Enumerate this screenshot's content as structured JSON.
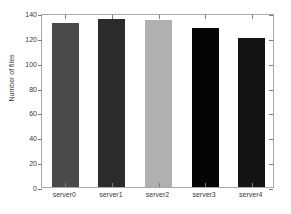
{
  "chart_data": {
    "type": "bar",
    "title": "",
    "xlabel": "",
    "ylabel": "Number of files",
    "categories": [
      "server0",
      "server1",
      "server2",
      "server3",
      "server4"
    ],
    "values": [
      132,
      135,
      134,
      128,
      120
    ],
    "bar_colors": [
      "#4a4a4a",
      "#2b2b2b",
      "#b0b0b0",
      "#050505",
      "#141414"
    ],
    "ylim": [
      0,
      140
    ],
    "yticks": [
      0,
      20,
      40,
      60,
      80,
      100,
      120,
      140
    ],
    "ytick_labels": [
      "0",
      "20",
      "40",
      "60",
      "80",
      "100",
      "120",
      "140"
    ],
    "grid": false,
    "legend": null,
    "axis_color": "#a9a9a9",
    "background": "#ffffff"
  }
}
